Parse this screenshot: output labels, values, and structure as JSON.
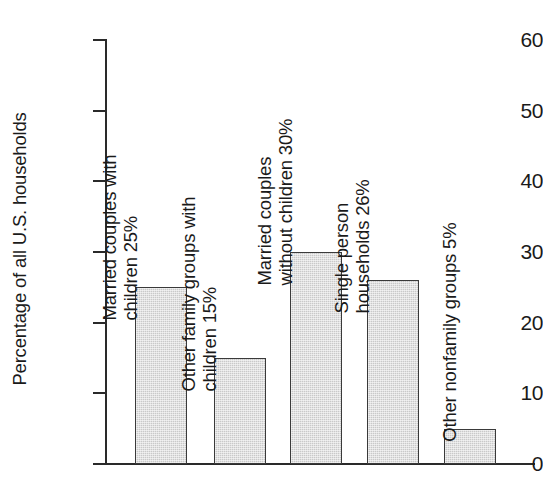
{
  "chart_data": {
    "type": "bar",
    "title": "",
    "subtitle": "",
    "xlabel": "",
    "ylabel": "Percentage of all U.S. households",
    "ylim": [
      0,
      60
    ],
    "ytick_values": [
      0,
      10,
      20,
      30,
      40,
      50,
      60
    ],
    "ytick_labels": [
      "0",
      "10",
      "20",
      "30",
      "40",
      "50",
      "60"
    ],
    "grid": false,
    "legend": null,
    "categories": [
      "Married couples with children",
      "Other family groups with children",
      "Married couples without children",
      "Single person households",
      "Other nonfamily groups"
    ],
    "values": [
      25,
      15,
      30,
      26,
      5
    ],
    "value_labels": [
      "25%",
      "15%",
      "30%",
      "26%",
      "5%"
    ],
    "bar_color": "#c9c9c9",
    "bar_edge_color": "#3a3a3a",
    "axis_color": "#2a2a2a",
    "annotations": [
      {
        "bar_index": 0,
        "lines": [
          "Married couples with",
          "children 25%"
        ],
        "rotation": 90
      },
      {
        "bar_index": 1,
        "lines": [
          "Other family groups with",
          "children 15%"
        ],
        "rotation": 90
      },
      {
        "bar_index": 2,
        "lines": [
          "Married couples",
          "without children 30%"
        ],
        "rotation": 90
      },
      {
        "bar_index": 3,
        "lines": [
          "Single person",
          "households 26%"
        ],
        "rotation": 90
      },
      {
        "bar_index": 4,
        "lines": [
          "Other nonfamily groups 5%"
        ],
        "rotation": 90
      }
    ]
  },
  "axis": {
    "y_title": "Percentage of all U.S. households",
    "ticks": [
      {
        "label": "60",
        "value": 60
      },
      {
        "label": "50",
        "value": 50
      },
      {
        "label": "40",
        "value": 40
      },
      {
        "label": "30",
        "value": 30
      },
      {
        "label": "20",
        "value": 20
      },
      {
        "label": "10",
        "value": 10
      },
      {
        "label": "0",
        "value": 0
      }
    ]
  },
  "bars": [
    {
      "name": "married-couples-with-children",
      "value": 25,
      "label_line1": "Married couples with",
      "label_line2": "children 25%"
    },
    {
      "name": "other-family-groups-with-children",
      "value": 15,
      "label_line1": "Other family groups with",
      "label_line2": "children 15%"
    },
    {
      "name": "married-couples-without-children",
      "value": 30,
      "label_line1": "Married couples",
      "label_line2": "without children 30%"
    },
    {
      "name": "single-person-households",
      "value": 26,
      "label_line1": "Single person",
      "label_line2": "households 26%"
    },
    {
      "name": "other-nonfamily-groups",
      "value": 5,
      "label_line1": "Other nonfamily groups 5%",
      "label_line2": ""
    }
  ]
}
